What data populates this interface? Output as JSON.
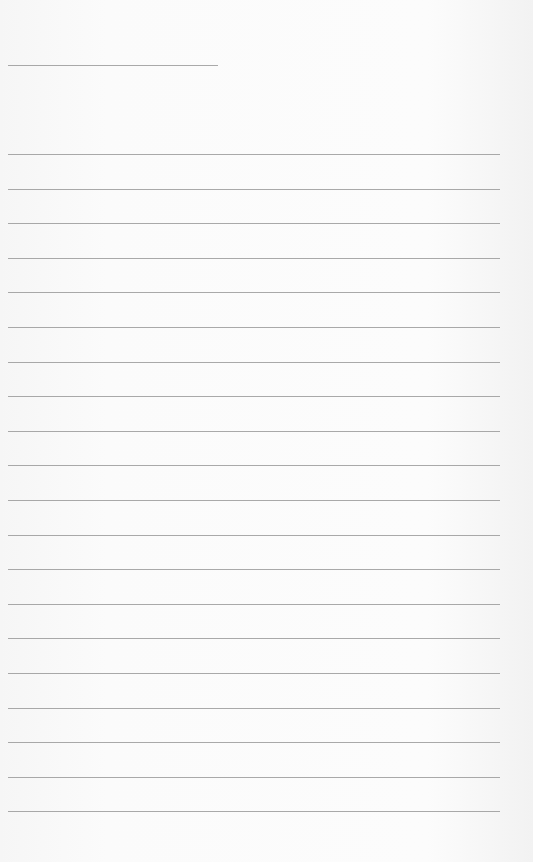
{
  "page": {
    "type": "blank lined sheet",
    "header_line": {
      "top": 65,
      "left": 8,
      "width": 210
    },
    "writing_lines": {
      "count": 20,
      "first_top": 154,
      "spacing": 34.6,
      "left": 8,
      "width": 492
    },
    "colors": {
      "paper": "#f9f9f9",
      "line": "#9a9a9a"
    }
  }
}
